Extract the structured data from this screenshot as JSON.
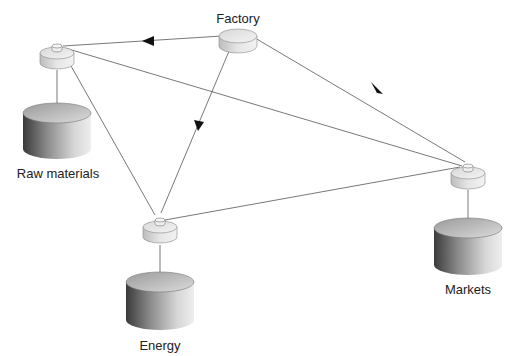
{
  "title": "",
  "nodes": [
    {
      "id": "factory",
      "label": "Factory",
      "kind": "hub"
    },
    {
      "id": "raw",
      "label": "Raw materials",
      "kind": "store"
    },
    {
      "id": "energy",
      "label": "Energy",
      "kind": "store"
    },
    {
      "id": "markets",
      "label": "Markets",
      "kind": "store"
    }
  ],
  "edges": [
    {
      "from": "factory",
      "to": "raw_hub",
      "arrow": true
    },
    {
      "from": "factory",
      "to": "energy_hub",
      "arrow": true
    },
    {
      "from": "factory",
      "to": "markets_hub",
      "arrow": true
    },
    {
      "from": "raw_hub",
      "to": "markets_hub",
      "arrow": false
    },
    {
      "from": "raw_hub",
      "to": "energy_hub",
      "arrow": false
    },
    {
      "from": "energy_hub",
      "to": "markets_hub",
      "arrow": false
    },
    {
      "from": "raw_hub",
      "to": "raw",
      "arrow": true
    },
    {
      "from": "energy_hub",
      "to": "energy",
      "arrow": true
    },
    {
      "from": "markets_hub",
      "to": "markets",
      "arrow": true
    }
  ],
  "colors": {
    "line": "#555555",
    "arrow": "#111111",
    "text": "#222222"
  }
}
